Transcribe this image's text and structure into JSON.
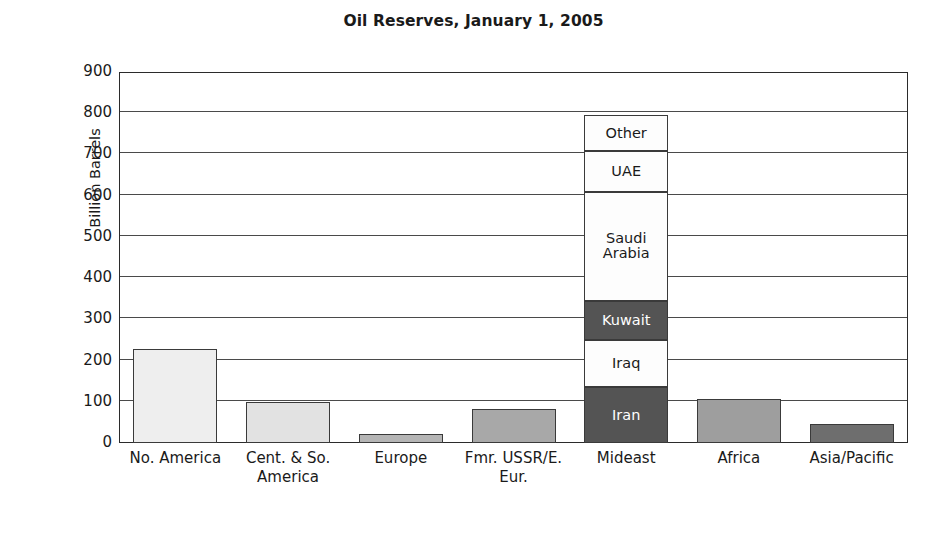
{
  "chart_data": {
    "type": "bar",
    "title": "Oil Reserves, January 1, 2005",
    "xlabel": "",
    "ylabel": "Billion Barrels",
    "ylim": [
      0,
      900
    ],
    "yticks": [
      0,
      100,
      200,
      300,
      400,
      500,
      600,
      700,
      800,
      900
    ],
    "ytick_labels": [
      "0",
      "100",
      "200",
      "300",
      "400",
      "500",
      "600",
      "700",
      "800",
      "900"
    ],
    "grid": true,
    "legend": "none",
    "stacked": true,
    "categories": [
      "No. America",
      "Cent. & So. America",
      "Europe",
      "Fmr. USSR/E. Eur.",
      "Mideast",
      "Africa",
      "Asia/Pacific"
    ],
    "values": [
      227,
      99,
      21,
      82,
      795,
      106,
      46
    ],
    "stack_category": "Mideast",
    "stack_segments": [
      {
        "label": "Iran",
        "value": 135,
        "shade": "dark"
      },
      {
        "label": "Iraq",
        "value": 115,
        "shade": "light"
      },
      {
        "label": "Kuwait",
        "value": 95,
        "shade": "dark"
      },
      {
        "label": "Saudi Arabia",
        "value": 265,
        "shade": "light"
      },
      {
        "label": "UAE",
        "value": 98,
        "shade": "light"
      },
      {
        "label": "Other",
        "value": 87,
        "shade": "light"
      }
    ],
    "bar_fills": [
      "#eeeeee",
      "#e2e2e2",
      "#b5b5b5",
      "#a8a8a8",
      "#ffffff",
      "#9e9e9e",
      "#6e6e6e"
    ],
    "colors": {
      "axis": "#2b2b2b",
      "grid": "#4a4a4a",
      "bar_edge": "#3a3a3a",
      "dark_segment": "#545454",
      "light_segment": "#fdfdfd",
      "background": "#ffffff",
      "text": "#1a1a1a"
    }
  }
}
